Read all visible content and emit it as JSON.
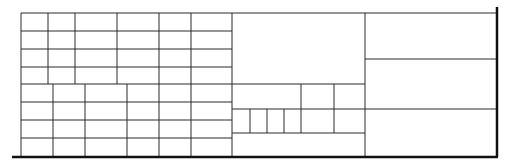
{
  "diagram": {
    "type": "grid-layout-drawing",
    "width": 510,
    "height": 167,
    "colors": {
      "line": "#2a2a2a",
      "thick": "#111111",
      "background": "#ffffff"
    },
    "frame": {
      "bottom_base": {
        "x1": 12,
        "y1": 157,
        "x2": 498,
        "y2": 157
      },
      "right_post": {
        "x1": 497,
        "y1": 7,
        "x2": 497,
        "y2": 157
      }
    },
    "sections": [
      {
        "name": "left-upper-grid",
        "horizontals": [
          {
            "x1": 21,
            "x2": 232,
            "y": 13
          },
          {
            "x1": 21,
            "x2": 232,
            "y": 31
          },
          {
            "x1": 21,
            "x2": 232,
            "y": 49
          },
          {
            "x1": 21,
            "x2": 232,
            "y": 67
          },
          {
            "x1": 21,
            "x2": 232,
            "y": 84
          }
        ],
        "verticals": [
          {
            "x": 21,
            "y1": 13,
            "y2": 84
          },
          {
            "x": 48,
            "y1": 13,
            "y2": 84
          },
          {
            "x": 75,
            "y1": 13,
            "y2": 84
          },
          {
            "x": 117,
            "y1": 13,
            "y2": 84
          },
          {
            "x": 159,
            "y1": 13,
            "y2": 84
          },
          {
            "x": 191,
            "y1": 13,
            "y2": 84
          }
        ]
      },
      {
        "name": "left-lower-grid",
        "horizontals": [
          {
            "x1": 21,
            "x2": 232,
            "y": 102
          },
          {
            "x1": 21,
            "x2": 232,
            "y": 120
          },
          {
            "x1": 21,
            "x2": 232,
            "y": 138
          }
        ],
        "verticals": [
          {
            "x": 21,
            "y1": 84,
            "y2": 156
          },
          {
            "x": 53,
            "y1": 84,
            "y2": 156
          },
          {
            "x": 85,
            "y1": 84,
            "y2": 156
          },
          {
            "x": 127,
            "y1": 84,
            "y2": 156
          },
          {
            "x": 159,
            "y1": 84,
            "y2": 156
          },
          {
            "x": 191,
            "y1": 84,
            "y2": 156
          }
        ]
      },
      {
        "name": "middle-block",
        "horizontals": [
          {
            "x1": 232,
            "x2": 365,
            "y": 13
          },
          {
            "x1": 232,
            "x2": 365,
            "y": 84
          },
          {
            "x1": 232,
            "x2": 497,
            "y": 109
          },
          {
            "x1": 232,
            "x2": 365,
            "y": 133
          }
        ],
        "verticals": [
          {
            "x": 232,
            "y1": 13,
            "y2": 156
          },
          {
            "x": 301,
            "y1": 84,
            "y2": 133
          },
          {
            "x": 334,
            "y1": 84,
            "y2": 133
          },
          {
            "x": 250,
            "y1": 109,
            "y2": 133
          },
          {
            "x": 267,
            "y1": 109,
            "y2": 133
          },
          {
            "x": 284,
            "y1": 109,
            "y2": 133
          }
        ]
      },
      {
        "name": "right-block",
        "horizontals": [
          {
            "x1": 365,
            "x2": 497,
            "y": 13
          },
          {
            "x1": 365,
            "x2": 497,
            "y": 59
          }
        ],
        "verticals": [
          {
            "x": 365,
            "y1": 13,
            "y2": 156
          }
        ]
      }
    ]
  }
}
